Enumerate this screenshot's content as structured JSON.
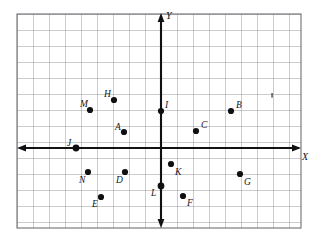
{
  "figure": {
    "kind": "cartesian-coordinate-plane",
    "background_color": "#ffffff",
    "grid": {
      "visible": true,
      "line_color": "#8a8a90",
      "cell_size_px": 16,
      "left_px": 17,
      "top_px": 14,
      "right_px": 301,
      "bottom_px": 228,
      "columns": 17.75,
      "rows": 13.4
    },
    "axes": {
      "color": "#111114",
      "origin_px": {
        "x": 161,
        "y": 148
      },
      "x_axis": {
        "label": "X",
        "label_px": {
          "x": 302,
          "y": 152
        },
        "start_px": {
          "x": 20,
          "y": 148
        },
        "end_px": {
          "x": 299,
          "y": 148
        },
        "arrow_both_ends": true
      },
      "y_axis": {
        "label": "Y",
        "label_px": {
          "x": 166,
          "y": 11
        },
        "start_px": {
          "x": 161,
          "y": 15
        },
        "end_px": {
          "x": 161,
          "y": 226
        },
        "arrow_both_ends": true
      }
    },
    "points": [
      {
        "label": "A",
        "dot_px": {
          "x": 124,
          "y": 132
        },
        "label_px": {
          "x": 115,
          "y": 123
        },
        "grid": {
          "x": -2.3,
          "y": 1.0
        }
      },
      {
        "label": "B",
        "dot_px": {
          "x": 231,
          "y": 111
        },
        "label_px": {
          "x": 236,
          "y": 101
        },
        "grid": {
          "x": 4.4,
          "y": 2.3
        }
      },
      {
        "label": "C",
        "dot_px": {
          "x": 196,
          "y": 131
        },
        "label_px": {
          "x": 201,
          "y": 121
        },
        "grid": {
          "x": 2.2,
          "y": 1.1
        }
      },
      {
        "label": "D",
        "dot_px": {
          "x": 125,
          "y": 172
        },
        "label_px": {
          "x": 116,
          "y": 176
        },
        "grid": {
          "x": -2.3,
          "y": -1.5
        }
      },
      {
        "label": "E",
        "dot_px": {
          "x": 101,
          "y": 197
        },
        "label_px": {
          "x": 92,
          "y": 200
        },
        "grid": {
          "x": -3.8,
          "y": -3.1
        }
      },
      {
        "label": "F",
        "dot_px": {
          "x": 183,
          "y": 196
        },
        "label_px": {
          "x": 187,
          "y": 199
        },
        "grid": {
          "x": 1.4,
          "y": -3.0
        }
      },
      {
        "label": "G",
        "dot_px": {
          "x": 240,
          "y": 174
        },
        "label_px": {
          "x": 244,
          "y": 178
        },
        "grid": {
          "x": 4.9,
          "y": -1.6
        }
      },
      {
        "label": "H",
        "dot_px": {
          "x": 114,
          "y": 100
        },
        "label_px": {
          "x": 104,
          "y": 90
        },
        "grid": {
          "x": -2.9,
          "y": 3.0
        }
      },
      {
        "label": "I",
        "dot_px": {
          "x": 161,
          "y": 111
        },
        "label_px": {
          "x": 165,
          "y": 101
        },
        "grid": {
          "x": 0.0,
          "y": 2.3
        }
      },
      {
        "label": "J",
        "dot_px": {
          "x": 76,
          "y": 148
        },
        "label_px": {
          "x": 67,
          "y": 139
        },
        "grid": {
          "x": -5.3,
          "y": 0.0
        }
      },
      {
        "label": "K",
        "dot_px": {
          "x": 171,
          "y": 164
        },
        "label_px": {
          "x": 175,
          "y": 168
        },
        "grid": {
          "x": 0.6,
          "y": -1.0
        }
      },
      {
        "label": "L",
        "dot_px": {
          "x": 161,
          "y": 186
        },
        "label_px": {
          "x": 151,
          "y": 189
        },
        "grid": {
          "x": 0.0,
          "y": -2.4
        }
      },
      {
        "label": "M",
        "dot_px": {
          "x": 90,
          "y": 110
        },
        "label_px": {
          "x": 80,
          "y": 100
        },
        "grid": {
          "x": -4.4,
          "y": 2.4
        }
      },
      {
        "label": "N",
        "dot_px": {
          "x": 88,
          "y": 172
        },
        "label_px": {
          "x": 79,
          "y": 176
        },
        "grid": {
          "x": -4.6,
          "y": -1.5
        }
      }
    ],
    "stray_mark": {
      "present": true,
      "px": {
        "x": 272,
        "y": 96
      }
    }
  }
}
